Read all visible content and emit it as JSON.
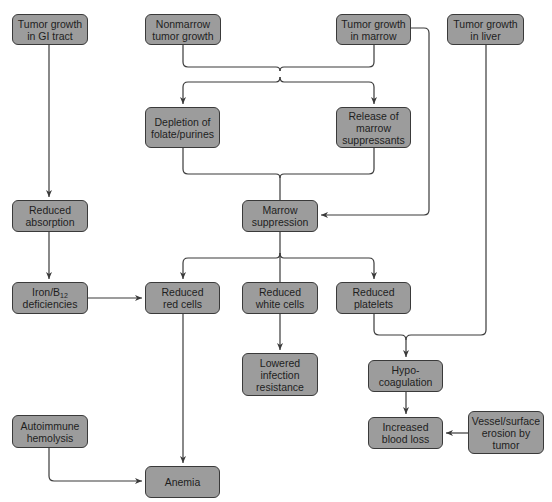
{
  "diagram": {
    "type": "flowchart",
    "colors": {
      "node_fill": "#9c9c9c",
      "node_border": "#3a3a3a",
      "edge": "#3a3a3a",
      "background": "#ffffff"
    },
    "nodes": {
      "gi_tract": {
        "line1": "Tumor growth",
        "line2": "in GI tract"
      },
      "nonmarrow": {
        "line1": "Nonmarrow",
        "line2": "tumor growth"
      },
      "marrow_growth": {
        "line1": "Tumor growth",
        "line2": "in marrow"
      },
      "liver": {
        "line1": "Tumor growth",
        "line2": "in liver"
      },
      "depletion": {
        "line1": "Depletion of",
        "line2": "folate/purines"
      },
      "release": {
        "line1": "Release of",
        "line2": "marrow",
        "line3": "suppressants"
      },
      "reduced_absorption": {
        "line1": "Reduced",
        "line2": "absorption"
      },
      "marrow_suppression": {
        "line1": "Marrow",
        "line2": "suppression"
      },
      "iron_b12": {
        "line1_prefix": "Iron/B",
        "line1_sub": "12",
        "line2": "deficiencies"
      },
      "red_cells": {
        "line1": "Reduced",
        "line2": "red cells"
      },
      "white_cells": {
        "line1": "Reduced",
        "line2": "white cells"
      },
      "platelets": {
        "line1": "Reduced",
        "line2": "platelets"
      },
      "lowered_infection": {
        "line1": "Lowered",
        "line2": "infection",
        "line3": "resistance"
      },
      "hypocoagulation": {
        "line1": "Hypo-",
        "line2": "coagulation"
      },
      "increased_blood_loss": {
        "line1": "Increased",
        "line2": "blood loss"
      },
      "vessel_erosion": {
        "line1": "Vessel/surface",
        "line2": "erosion by",
        "line3": "tumor"
      },
      "autoimmune": {
        "line1": "Autoimmune",
        "line2": "hemolysis"
      },
      "anemia": {
        "line1": "Anemia"
      }
    },
    "edges": [
      [
        "Tumor growth in GI tract",
        "Reduced absorption"
      ],
      [
        "Reduced absorption",
        "Iron/B12 deficiencies"
      ],
      [
        "Iron/B12 deficiencies",
        "Reduced red cells"
      ],
      [
        "Nonmarrow tumor growth",
        "Depletion of folate/purines"
      ],
      [
        "Nonmarrow tumor growth",
        "Release of marrow suppressants"
      ],
      [
        "Tumor growth in marrow",
        "Depletion of folate/purines"
      ],
      [
        "Tumor growth in marrow",
        "Release of marrow suppressants"
      ],
      [
        "Tumor growth in marrow",
        "Marrow suppression"
      ],
      [
        "Depletion of folate/purines",
        "Marrow suppression"
      ],
      [
        "Release of marrow suppressants",
        "Marrow suppression"
      ],
      [
        "Marrow suppression",
        "Reduced red cells"
      ],
      [
        "Marrow suppression",
        "Reduced white cells"
      ],
      [
        "Marrow suppression",
        "Reduced platelets"
      ],
      [
        "Reduced white cells",
        "Lowered infection resistance"
      ],
      [
        "Reduced platelets",
        "Hypo-coagulation"
      ],
      [
        "Tumor growth in liver",
        "Hypo-coagulation"
      ],
      [
        "Hypo-coagulation",
        "Increased blood loss"
      ],
      [
        "Vessel/surface erosion by tumor",
        "Increased blood loss"
      ],
      [
        "Reduced red cells",
        "Anemia"
      ],
      [
        "Autoimmune hemolysis",
        "Anemia"
      ]
    ]
  }
}
